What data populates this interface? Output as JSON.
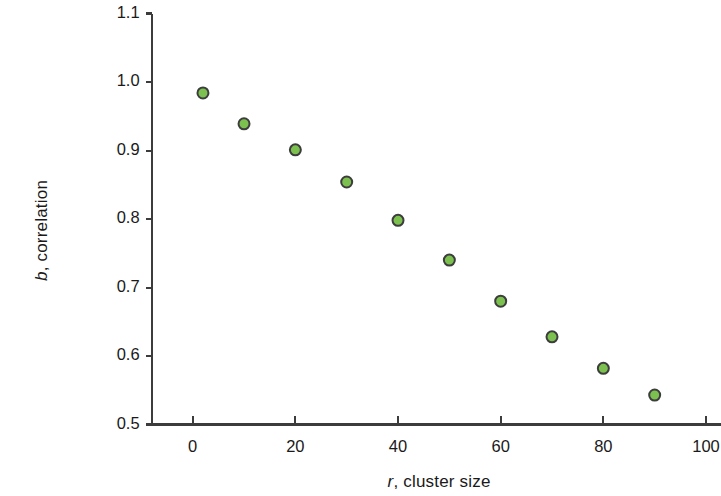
{
  "chart_data": {
    "type": "scatter",
    "title": "",
    "xlabel": "r, cluster size",
    "ylabel": "b, correlation",
    "xlabel_symbol": "r",
    "xlabel_rest": ", cluster size",
    "ylabel_symbol": "b",
    "ylabel_rest": ", correlation",
    "xlim": [
      -8,
      104
    ],
    "ylim": [
      0.5,
      1.1
    ],
    "xticks": [
      0,
      20,
      40,
      60,
      80,
      100
    ],
    "xtick_labels": [
      "0",
      "20",
      "40",
      "60",
      "80",
      "100"
    ],
    "yticks": [
      0.5,
      0.6,
      0.7,
      0.8,
      0.9,
      1.0,
      1.1
    ],
    "ytick_labels": [
      "0.5",
      "0.6",
      "0.7",
      "0.8",
      "0.9",
      "1.0",
      "1.1"
    ],
    "grid": false,
    "legend": "none",
    "series": [
      {
        "name": "b, correlation",
        "marker": "circle",
        "marker_fill": "#7cc04f",
        "marker_edge": "#3d3d3d",
        "marker_size": 11,
        "x": [
          2,
          10,
          20,
          30,
          40,
          50,
          60,
          70,
          80,
          90
        ],
        "y": [
          0.984,
          0.939,
          0.901,
          0.854,
          0.798,
          0.74,
          0.68,
          0.628,
          0.582,
          0.543
        ]
      }
    ]
  },
  "style": {
    "axis_color": "#3c3c3c",
    "background": "#ffffff",
    "text_color": "#1a1a1a"
  }
}
